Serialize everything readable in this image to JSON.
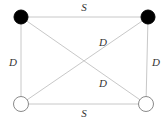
{
  "diagram": {
    "width": 167,
    "height": 121,
    "nodes": [
      {
        "id": "top-left",
        "x": 21,
        "y": 17,
        "r": 7,
        "style": "filled",
        "color": "#000000"
      },
      {
        "id": "top-right",
        "x": 148,
        "y": 17,
        "r": 7,
        "style": "filled",
        "color": "#000000"
      },
      {
        "id": "bottom-left",
        "x": 21,
        "y": 104,
        "r": 7.5,
        "style": "hollow",
        "color": "#ffffff"
      },
      {
        "id": "bottom-right",
        "x": 146,
        "y": 104,
        "r": 7.5,
        "style": "hollow",
        "color": "#ffffff"
      }
    ],
    "edges": [
      {
        "from": "top-left",
        "to": "top-right",
        "label": "S"
      },
      {
        "from": "bottom-left",
        "to": "bottom-right",
        "label": "S"
      },
      {
        "from": "top-left",
        "to": "bottom-left",
        "label": "D"
      },
      {
        "from": "top-right",
        "to": "bottom-right",
        "label": "D"
      },
      {
        "from": "bottom-left",
        "to": "top-right",
        "label": "D"
      },
      {
        "from": "top-left",
        "to": "bottom-right",
        "label": "D"
      }
    ],
    "labels": {
      "top": "S",
      "bottom": "S",
      "left": "D",
      "right": "D",
      "diag_upper": "D",
      "diag_lower": "D"
    },
    "edge_color": "#c8c8c8",
    "label_color": "#333333"
  }
}
